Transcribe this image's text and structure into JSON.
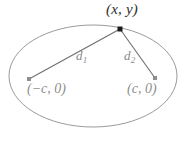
{
  "figure": {
    "background_color": "#ffffff",
    "width": 182,
    "height": 142,
    "colors": {
      "ellipse_stroke": "#9a9a9a",
      "segment_stroke": "#6e6e6e",
      "vertex_dot": "#1a1a1a",
      "focus_dot": "#8e8e8e",
      "vertex_label": "#2b2b2b",
      "distance_label": "#8a8a8a",
      "focus_label": "#8e8e8e"
    },
    "ellipse": {
      "center_x": 93,
      "center_y": 76,
      "radius_x": 84,
      "radius_y": 51,
      "stroke_width": 1
    },
    "points": {
      "vertex": {
        "x": 120,
        "y": 29,
        "size": 5,
        "shape": "square"
      },
      "focus_left": {
        "x": 29,
        "y": 79,
        "size": 4,
        "shape": "square"
      },
      "focus_right": {
        "x": 155,
        "y": 78,
        "size": 4,
        "shape": "square"
      }
    },
    "segments": [
      {
        "name": "d1",
        "x1": 29,
        "y1": 79,
        "x2": 120,
        "y2": 29
      },
      {
        "name": "d2",
        "x1": 120,
        "y1": 29,
        "x2": 155,
        "y2": 78
      }
    ]
  },
  "labels": {
    "vertex": "(x, y)",
    "distance_1_base": "d",
    "distance_1_sub": "1",
    "distance_2_base": "d",
    "distance_2_sub": "2",
    "focus_left": "(−c, 0)",
    "focus_right": "(c, 0)"
  }
}
